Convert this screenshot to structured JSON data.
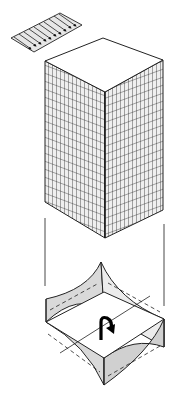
{
  "figure": {
    "title": "Tall building under wind load with torsional twisting of plan",
    "colors": {
      "ink": "#1a1a1a",
      "shade": "#d9d9d9",
      "paper": "#ffffff",
      "facade_fill": "#ececec"
    },
    "parts": [
      {
        "name": "wind-load-panel",
        "description": "Hatched strip with arrows indicating wind pressure",
        "arrow_count": 9
      },
      {
        "name": "tower",
        "description": "Isometric tall rectangular tower with grid facade"
      },
      {
        "name": "guide-lines",
        "description": "Vertical projection lines connecting tower to plan"
      },
      {
        "name": "twisted-plan",
        "description": "Deformed floor plan with concave curved edges and torsion arrow"
      }
    ],
    "torsion_symbol": "↻"
  }
}
